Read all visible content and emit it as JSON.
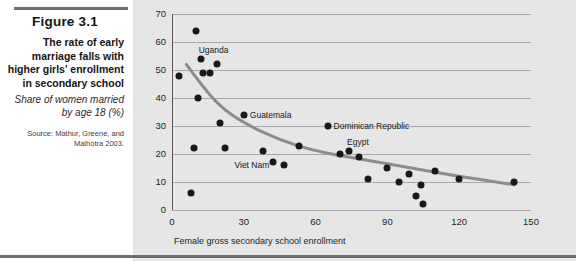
{
  "caption": {
    "figure_number": "Figure 3.1",
    "title": "The rate of early marriage falls with higher girls' enrollment in secondary school",
    "subtitle": "Share of women married by age 18 (%)",
    "source": "Source: Mathur, Greene, and Malhotra 2003."
  },
  "colors": {
    "panel_background": "#e6e6e6",
    "caption_background": "#ffffff",
    "marker": "#18181a",
    "trend_line": "#8c8c90",
    "grid": "#a8a8ac",
    "rule": "#6e6e72"
  },
  "chart_data": {
    "type": "scatter",
    "title": "The rate of early marriage falls with higher girls' enrollment in secondary school",
    "subtitle": "Share of women married by age 18 (%)",
    "xlabel": "Female gross secondary school enrollment",
    "ylabel": "",
    "xlim": [
      0,
      150
    ],
    "ylim": [
      0,
      70
    ],
    "xticks": [
      0,
      30,
      60,
      90,
      120,
      150
    ],
    "yticks": [
      0,
      10,
      20,
      30,
      40,
      50,
      60,
      70
    ],
    "grid": "horizontal",
    "legend": "none",
    "points": [
      {
        "x": 3,
        "y": 48,
        "label": ""
      },
      {
        "x": 8,
        "y": 6,
        "label": ""
      },
      {
        "x": 9,
        "y": 22,
        "label": ""
      },
      {
        "x": 10,
        "y": 64,
        "label": ""
      },
      {
        "x": 11,
        "y": 40,
        "label": ""
      },
      {
        "x": 12,
        "y": 54,
        "label": "Uganda"
      },
      {
        "x": 13,
        "y": 49,
        "label": ""
      },
      {
        "x": 16,
        "y": 49,
        "label": ""
      },
      {
        "x": 19,
        "y": 52,
        "label": ""
      },
      {
        "x": 20,
        "y": 31,
        "label": ""
      },
      {
        "x": 22,
        "y": 22,
        "label": ""
      },
      {
        "x": 30,
        "y": 34,
        "label": "Guatemala"
      },
      {
        "x": 38,
        "y": 21,
        "label": ""
      },
      {
        "x": 42,
        "y": 17,
        "label": ""
      },
      {
        "x": 47,
        "y": 16,
        "label": "Viet Nam"
      },
      {
        "x": 53,
        "y": 23,
        "label": ""
      },
      {
        "x": 65,
        "y": 30,
        "label": "Dominican Republic"
      },
      {
        "x": 70,
        "y": 20,
        "label": ""
      },
      {
        "x": 74,
        "y": 21,
        "label": "Egypt"
      },
      {
        "x": 78,
        "y": 19,
        "label": ""
      },
      {
        "x": 82,
        "y": 11,
        "label": ""
      },
      {
        "x": 90,
        "y": 15,
        "label": ""
      },
      {
        "x": 95,
        "y": 10,
        "label": ""
      },
      {
        "x": 99,
        "y": 13,
        "label": ""
      },
      {
        "x": 102,
        "y": 5,
        "label": ""
      },
      {
        "x": 104,
        "y": 9,
        "label": ""
      },
      {
        "x": 105,
        "y": 2,
        "label": ""
      },
      {
        "x": 110,
        "y": 14,
        "label": ""
      },
      {
        "x": 120,
        "y": 11,
        "label": ""
      },
      {
        "x": 143,
        "y": 10,
        "label": ""
      }
    ],
    "trend_line": {
      "description": "Fitted declining curve",
      "points": [
        {
          "x": 6,
          "y": 52
        },
        {
          "x": 12,
          "y": 45
        },
        {
          "x": 20,
          "y": 37
        },
        {
          "x": 30,
          "y": 31
        },
        {
          "x": 45,
          "y": 25
        },
        {
          "x": 60,
          "y": 21
        },
        {
          "x": 80,
          "y": 18
        },
        {
          "x": 100,
          "y": 15
        },
        {
          "x": 120,
          "y": 12
        },
        {
          "x": 143,
          "y": 9
        }
      ]
    }
  }
}
